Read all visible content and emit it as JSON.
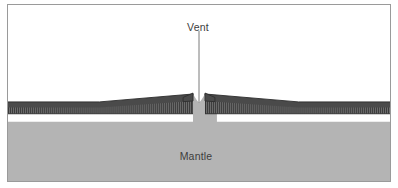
{
  "figure": {
    "kind": "geology-cross-section-diagram",
    "width": 398,
    "height": 188,
    "border_color": "#9a9a9a",
    "background_color": "#ffffff"
  },
  "labels": {
    "vent": "Vent",
    "mantle": "Mantle"
  },
  "colors": {
    "water": "#ffffff",
    "mantle": "#b4b4b4",
    "crust_upper": "#4a4a4a",
    "crust_lower": "#6e6e6e",
    "crust_hatch": "#3a3a3a",
    "outline": "#2b2b2b",
    "leader_line": "#6b6b6b",
    "text": "#3d3d3d"
  },
  "geometry": {
    "vent_center_x": 199,
    "vent_gap_half_width": 6,
    "vent_notch_bottom_y": 130,
    "seafloor_base_y": 112,
    "ridge_peak_y": 104,
    "ridge_slope_start_left_x": 95,
    "ridge_slope_start_right_x": 303,
    "mantle_top_y": 122,
    "crust_thickness": 10,
    "leader_line_top_y": 30,
    "leader_line_bottom_y": 113
  },
  "annotations": {
    "vent_leader": "vertical-leader-line"
  }
}
